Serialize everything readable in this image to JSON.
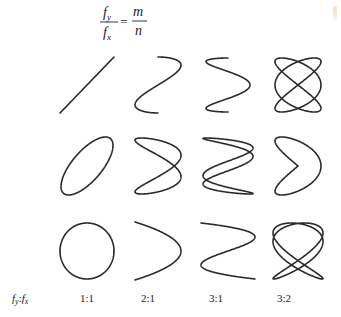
{
  "formula": {
    "numerator": "f",
    "numerator_sub": "y",
    "denominator": "f",
    "denominator_sub": "x",
    "equals": "=",
    "rhs_numerator": "m",
    "rhs_denominator": "n"
  },
  "ratio_axis_label": {
    "f1": "f",
    "sub1": "y",
    "colon": ":",
    "f2": "f",
    "sub2": "x"
  },
  "columns": [
    {
      "ratio": "1:1",
      "m": 1,
      "n": 1
    },
    {
      "ratio": "2:1",
      "m": 2,
      "n": 1
    },
    {
      "ratio": "3:1",
      "m": 3,
      "n": 1
    },
    {
      "ratio": "3:2",
      "m": 3,
      "n": 2
    }
  ],
  "rows": [
    {
      "name": "row-1",
      "phase_label": "phase A"
    },
    {
      "name": "row-2",
      "phase_label": "phase B"
    },
    {
      "name": "row-3",
      "phase_label": "phase C"
    }
  ],
  "figures": [
    [
      {
        "ratio": "1:1",
        "description": "straight diagonal line",
        "phase_deg": 0
      },
      {
        "ratio": "2:1",
        "description": "figure-eight (two lobes)",
        "phase_deg": 0
      },
      {
        "ratio": "3:1",
        "description": "open N-shaped curve",
        "phase_deg": 90
      },
      {
        "ratio": "3:2",
        "description": "closed knot with multiple crossings",
        "phase_deg": 0
      }
    ],
    [
      {
        "ratio": "1:1",
        "description": "tilted ellipse",
        "phase_deg": 45
      },
      {
        "ratio": "2:1",
        "description": "twisted two-lobe loop",
        "phase_deg": 45
      },
      {
        "ratio": "3:1",
        "description": "three interleaved loops",
        "phase_deg": 30
      },
      {
        "ratio": "3:2",
        "description": "open fish-shaped curve",
        "phase_deg": 90
      }
    ],
    [
      {
        "ratio": "1:1",
        "description": "circle",
        "phase_deg": 90
      },
      {
        "ratio": "2:1",
        "description": "parabola arch",
        "phase_deg": 90
      },
      {
        "ratio": "3:1",
        "description": "three-lobe chain",
        "phase_deg": 0
      },
      {
        "ratio": "3:2",
        "description": "closed knot pattern",
        "phase_deg": 30
      }
    ]
  ],
  "colors": {
    "stroke": "#2a2a2a",
    "text": "#222222",
    "background": "#ffffff"
  }
}
